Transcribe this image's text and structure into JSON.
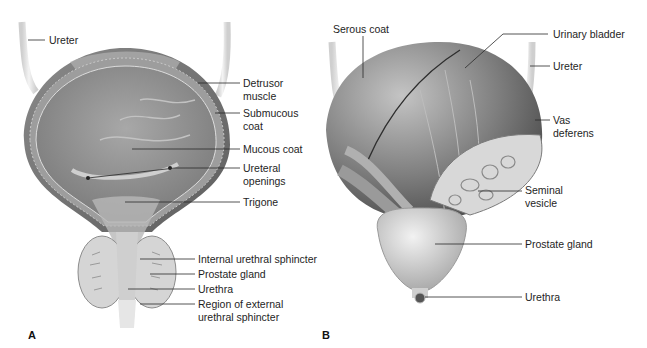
{
  "figure": {
    "panels": [
      {
        "id": "A",
        "letter": "A",
        "view": "frontal section of urinary bladder",
        "labels": {
          "ureter": "Ureter",
          "detrusor_1": "Detrusor",
          "detrusor_2": "muscle",
          "submucous_1": "Submucous",
          "submucous_2": "coat",
          "mucous": "Mucous coat",
          "ureteral_1": "Ureteral",
          "ureteral_2": "openings",
          "trigone": "Trigone",
          "internal_sphincter": "Internal urethral sphincter",
          "prostate": "Prostate gland",
          "urethra": "Urethra",
          "external_1": "Region of external",
          "external_2": "urethral sphincter"
        }
      },
      {
        "id": "B",
        "letter": "B",
        "view": "posterior view of urinary bladder",
        "labels": {
          "serous": "Serous coat",
          "bladder": "Urinary bladder",
          "ureter": "Ureter",
          "vas_1": "Vas",
          "vas_2": "deferens",
          "seminal_1": "Seminal",
          "seminal_2": "vesicle",
          "prostate": "Prostate gland",
          "urethra": "Urethra"
        }
      }
    ],
    "colors": {
      "background": "#ffffff",
      "leader_line": "#2a2a2a",
      "tissue_dark": "#6e6e6e",
      "tissue_mid": "#9a9a9a",
      "tissue_light": "#d8d8d8"
    }
  }
}
